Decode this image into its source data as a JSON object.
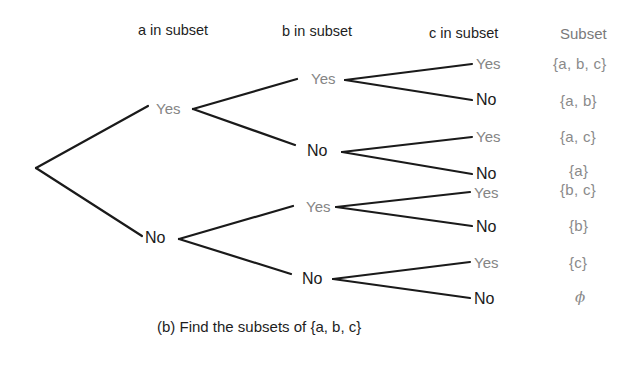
{
  "headers": {
    "a": "a in subset",
    "b": "b in subset",
    "c": "c in subset",
    "subset": "Subset"
  },
  "level1": [
    {
      "label": "Yes"
    },
    {
      "label": "No"
    }
  ],
  "level2": [
    {
      "label": "Yes"
    },
    {
      "label": "No"
    },
    {
      "label": "Yes"
    },
    {
      "label": "No"
    }
  ],
  "level3": [
    {
      "label": "Yes",
      "subset": "{a, b, c}"
    },
    {
      "label": "No",
      "subset": "{a, b}"
    },
    {
      "label": "Yes",
      "subset": "{a, c}"
    },
    {
      "label": "No",
      "subset": "{a}"
    },
    {
      "label": "Yes",
      "subset": "{b, c}"
    },
    {
      "label": "No",
      "subset": "{b}"
    },
    {
      "label": "Yes",
      "subset": "{c}"
    },
    {
      "label": "No",
      "subset": "ϕ"
    }
  ],
  "caption": "(b) Find the subsets of {a, b, c}",
  "colors": {
    "line": "#1a1a1a",
    "yes_text": "#858585",
    "no_text": "#1a1a1a",
    "subset_text": "#8a8a8a"
  }
}
